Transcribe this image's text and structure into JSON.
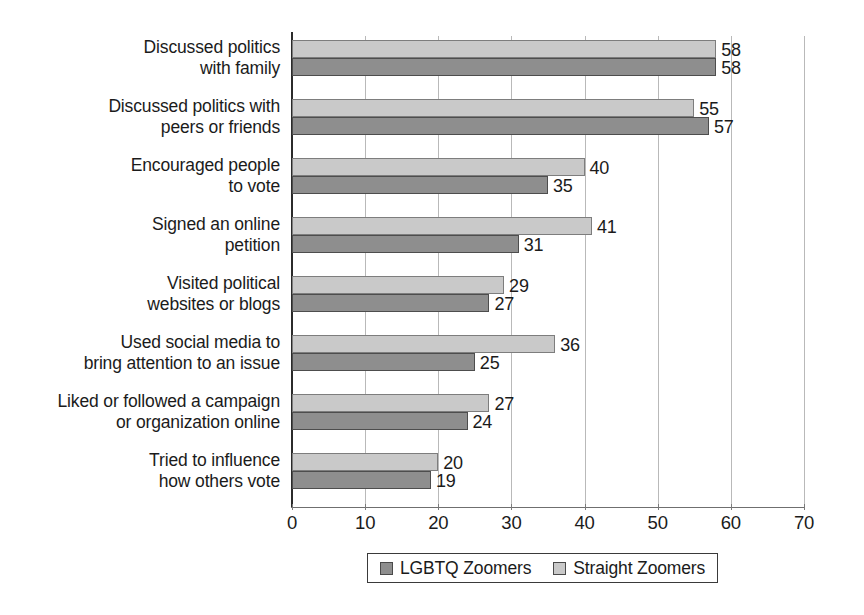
{
  "chart_data": {
    "type": "bar",
    "orientation": "horizontal",
    "title": "",
    "xlabel": "",
    "ylabel": "",
    "xlim": [
      0,
      70
    ],
    "xticks": [
      0,
      10,
      20,
      30,
      40,
      50,
      60,
      70
    ],
    "grid": true,
    "legend_position": "bottom",
    "categories": [
      "Discussed politics\nwith family",
      "Discussed politics with\npeers or friends",
      "Encouraged people\nto vote",
      "Signed an online\npetition",
      "Visited political\nwebsites or blogs",
      "Used social media to\nbring attention to an issue",
      "Liked or followed a campaign\nor organization online",
      "Tried to influence\nhow others vote"
    ],
    "series": [
      {
        "name": "Straight Zoomers",
        "color": "#c9c9c9",
        "values": [
          58,
          55,
          40,
          41,
          29,
          36,
          27,
          20
        ]
      },
      {
        "name": "LGBTQ Zoomers",
        "color": "#8e8e8e",
        "values": [
          58,
          57,
          35,
          31,
          27,
          25,
          24,
          19
        ]
      }
    ]
  },
  "legend": {
    "items": [
      {
        "label": "LGBTQ Zoomers",
        "swatch": "dark"
      },
      {
        "label": "Straight Zoomers",
        "swatch": "light"
      }
    ]
  }
}
